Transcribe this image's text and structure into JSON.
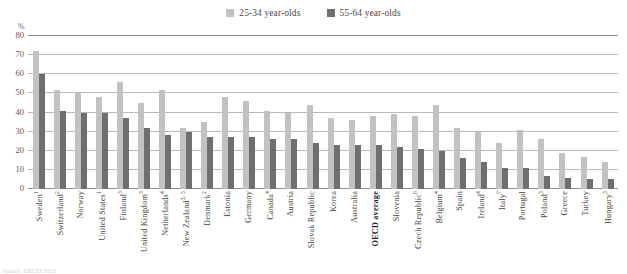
{
  "chart_data": {
    "type": "bar",
    "title": "",
    "xlabel": "",
    "ylabel": "%",
    "ylim": [
      0,
      80
    ],
    "yticks": [
      0,
      10,
      20,
      30,
      40,
      50,
      60,
      70,
      80
    ],
    "grid": true,
    "legend_position": "top-center",
    "categories": [
      "Sweden",
      "Switzerland",
      "Norway",
      "United States",
      "Finland",
      "United Kingdom",
      "Netherlands",
      "New Zealand",
      "Denmark",
      "Estonia",
      "Germany",
      "Canada",
      "Austria",
      "Slovak Republic",
      "Korea",
      "Australia",
      "OECD average",
      "Slovenia",
      "Czech Republic",
      "Belgium",
      "Spain",
      "Ireland",
      "Italy",
      "Portugal",
      "Poland",
      "Greece",
      "Turkey",
      "Hungary"
    ],
    "category_footnote_marks": [
      "1",
      "2",
      "",
      "1",
      "3",
      "3",
      "4",
      "3, 5",
      "2",
      "",
      "",
      "4",
      "",
      "",
      "",
      "",
      "",
      "",
      "6",
      "4",
      "",
      "4",
      "7",
      "",
      "3",
      "",
      "",
      "3"
    ],
    "category_highlight": [
      false,
      false,
      false,
      false,
      false,
      false,
      false,
      false,
      false,
      false,
      false,
      false,
      false,
      false,
      false,
      false,
      true,
      false,
      false,
      false,
      false,
      false,
      false,
      false,
      false,
      false,
      false,
      false
    ],
    "series": [
      {
        "name": "25-34 year-olds",
        "color": "#c2c2c2",
        "values": [
          72,
          52,
          50,
          48,
          56,
          45,
          52,
          32,
          35,
          48,
          46,
          41,
          40,
          44,
          37,
          36,
          38,
          39,
          38,
          44,
          32,
          30,
          24,
          31,
          26,
          19,
          17,
          14
        ]
      },
      {
        "name": "55-64 year-olds",
        "color": "#6f6f6f",
        "values": [
          60,
          41,
          40,
          40,
          37,
          32,
          28,
          30,
          27,
          27,
          27,
          26,
          26,
          24,
          23,
          23,
          23,
          22,
          21,
          20,
          16,
          14,
          11,
          11,
          7,
          6,
          5,
          5
        ]
      }
    ],
    "legend": [
      {
        "label": "25-34 year-olds",
        "color": "#c2c2c2"
      },
      {
        "label": "55-64 year-olds",
        "color": "#6f6f6f"
      }
    ]
  },
  "footnote": "Source: OECD 2012"
}
